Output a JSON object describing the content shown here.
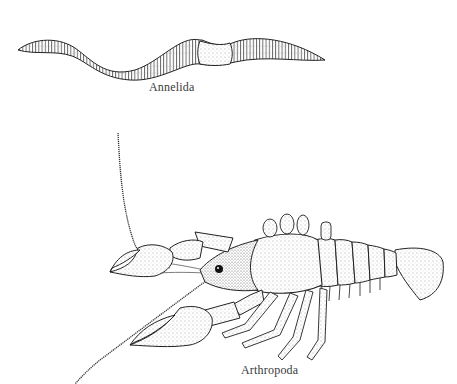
{
  "figure": {
    "specimens": [
      {
        "id": "annelida",
        "label": "Annelida",
        "subject": "earthworm"
      },
      {
        "id": "arthropoda",
        "label": "Arthropoda",
        "subject": "crayfish"
      }
    ],
    "colors": {
      "ink": "#222222",
      "background": "#ffffff",
      "label": "#3a3a3a"
    }
  }
}
